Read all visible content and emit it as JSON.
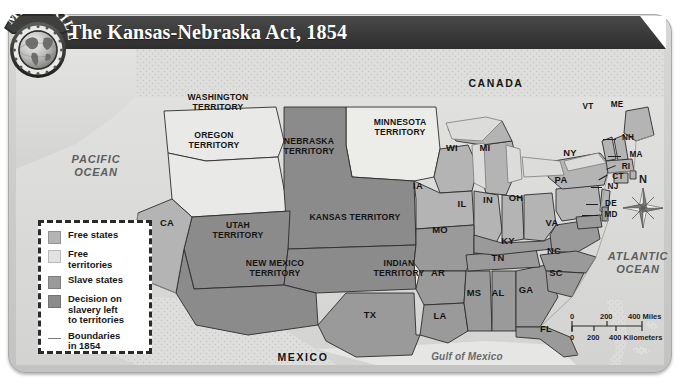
{
  "badge": {
    "text_top": "MAP",
    "text_bottom": "SKILL",
    "icon": "globe-icon"
  },
  "header": {
    "title": "The Kansas-Nebraska Act, 1854"
  },
  "legend": {
    "items": [
      {
        "label": "Free states",
        "color": "#b4b4b4",
        "swatch": "box"
      },
      {
        "label": "Free\nterritories",
        "color": "#e2e2e2",
        "swatch": "box"
      },
      {
        "label": "Slave states",
        "color": "#9a9a9a",
        "swatch": "box"
      },
      {
        "label": "Decision on\nslavery left\nto territories",
        "color": "#8b8b8b",
        "swatch": "box"
      },
      {
        "label": "Boundaries\nin 1854",
        "color": "#7a7a7a",
        "swatch": "line"
      }
    ]
  },
  "scale": {
    "miles": {
      "ticks": [
        "0",
        "200",
        "400"
      ],
      "unit": "Miles"
    },
    "kilometers": {
      "ticks": [
        "0",
        "200",
        "400"
      ],
      "unit": "Kilometers"
    }
  },
  "compass": {
    "north_label": "N",
    "icon": "compass-rose-icon"
  },
  "map": {
    "oceans": [
      {
        "name": "pacific-ocean",
        "label": "PACIFIC\nOCEAN"
      },
      {
        "name": "atlantic-ocean",
        "label": "ATLANTIC\nOCEAN"
      },
      {
        "name": "gulf-of-mexico",
        "label": "Gulf of Mexico"
      }
    ],
    "countries": [
      {
        "name": "canada",
        "label": "CANADA"
      },
      {
        "name": "mexico",
        "label": "MEXICO"
      }
    ],
    "territories": [
      {
        "label": "WASHINGTON\nTERRITORY",
        "category": "free-territory"
      },
      {
        "label": "OREGON\nTERRITORY",
        "category": "free-territory"
      },
      {
        "label": "MINNESOTA\nTERRITORY",
        "category": "free-territory"
      },
      {
        "label": "NEBRASKA\nTERRITORY",
        "category": "decision-on-slavery"
      },
      {
        "label": "UTAH\nTERRITORY",
        "category": "decision-on-slavery"
      },
      {
        "label": "KANSAS TERRITORY",
        "category": "decision-on-slavery"
      },
      {
        "label": "NEW MEXICO\nTERRITORY",
        "category": "decision-on-slavery"
      },
      {
        "label": "INDIAN\nTERRITORY",
        "category": "free-territory"
      }
    ],
    "states": [
      {
        "abbr": "CA",
        "category": "free-state"
      },
      {
        "abbr": "WI",
        "category": "free-state"
      },
      {
        "abbr": "MI",
        "category": "free-state"
      },
      {
        "abbr": "IA",
        "category": "free-state"
      },
      {
        "abbr": "IL",
        "category": "free-state"
      },
      {
        "abbr": "IN",
        "category": "free-state"
      },
      {
        "abbr": "OH",
        "category": "free-state"
      },
      {
        "abbr": "NY",
        "category": "free-state"
      },
      {
        "abbr": "PA",
        "category": "free-state"
      },
      {
        "abbr": "VT",
        "category": "free-state"
      },
      {
        "abbr": "ME",
        "category": "free-state"
      },
      {
        "abbr": "NH",
        "category": "free-state"
      },
      {
        "abbr": "MA",
        "category": "free-state"
      },
      {
        "abbr": "RI",
        "category": "free-state"
      },
      {
        "abbr": "CT",
        "category": "free-state"
      },
      {
        "abbr": "NJ",
        "category": "free-state"
      },
      {
        "abbr": "DE",
        "category": "slave-state"
      },
      {
        "abbr": "MD",
        "category": "slave-state"
      },
      {
        "abbr": "VA",
        "category": "slave-state"
      },
      {
        "abbr": "MO",
        "category": "slave-state"
      },
      {
        "abbr": "KY",
        "category": "slave-state"
      },
      {
        "abbr": "TN",
        "category": "slave-state"
      },
      {
        "abbr": "NC",
        "category": "slave-state"
      },
      {
        "abbr": "SC",
        "category": "slave-state"
      },
      {
        "abbr": "AR",
        "category": "slave-state"
      },
      {
        "abbr": "MS",
        "category": "slave-state"
      },
      {
        "abbr": "AL",
        "category": "slave-state"
      },
      {
        "abbr": "GA",
        "category": "slave-state"
      },
      {
        "abbr": "LA",
        "category": "slave-state"
      },
      {
        "abbr": "FL",
        "category": "slave-state"
      },
      {
        "abbr": "TX",
        "category": "slave-state"
      }
    ]
  },
  "colors": {
    "free_state": "#b4b4b4",
    "free_territory": "#e6e6e4",
    "slave_state": "#9a9a9a",
    "decision_territory": "#8b8b8b",
    "water": "#dcddda",
    "land_outside": "#d6d7d4",
    "boundary": "#2d2d2d",
    "title_bar": "#3a3a3a"
  }
}
